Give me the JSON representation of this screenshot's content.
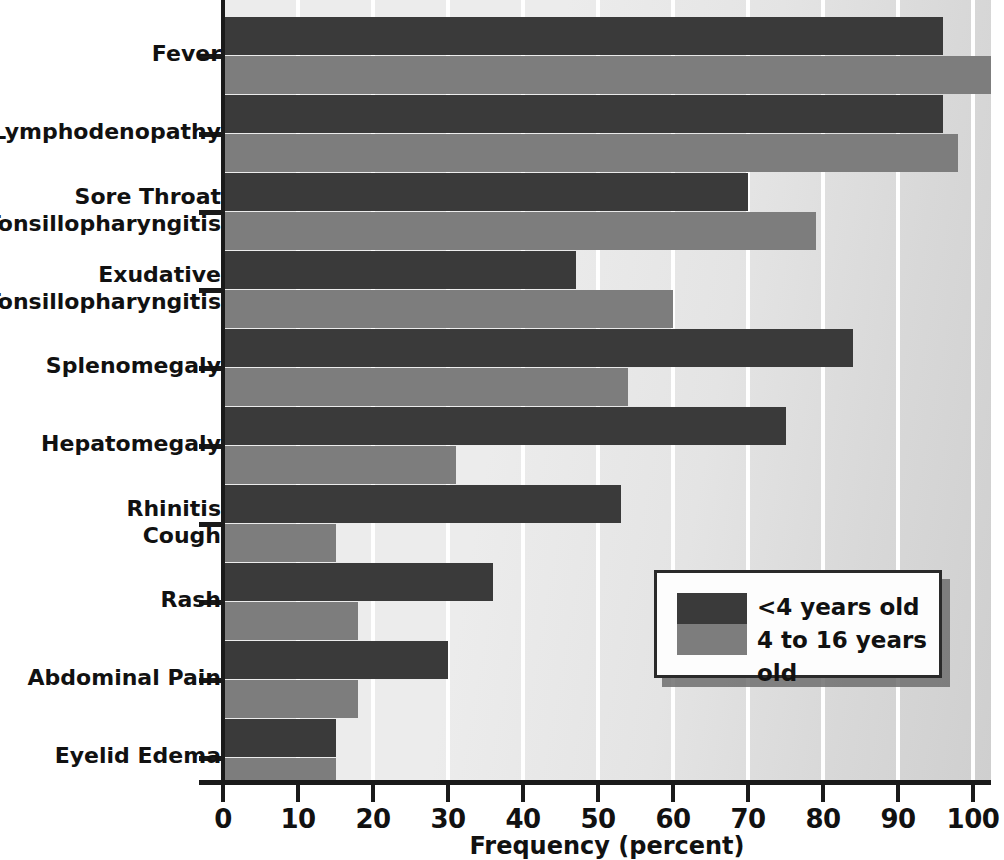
{
  "chart_data": {
    "type": "bar",
    "orientation": "horizontal",
    "title": "",
    "xlabel": "Frequency (percent)",
    "ylabel": "",
    "xlim": [
      0,
      103
    ],
    "xticks": [
      0,
      10,
      20,
      30,
      40,
      50,
      60,
      70,
      80,
      90,
      100
    ],
    "xtick_labels": [
      "0",
      "10",
      "20",
      "30",
      "40",
      "50",
      "60",
      "70",
      "80",
      "90",
      "100"
    ],
    "grid": "vertical",
    "legend_position": "inside-lower-right",
    "categories": [
      "Fever",
      "Lymphodenopathy",
      "Sore Throat\nTonsillopharyngitis",
      "Exudative\nTonsillopharyngitis",
      "Splenomegaly",
      "Hepatomegaly",
      "Rhinitis\nCough",
      "Rash",
      "Abdominal Pain",
      "Eyelid Edema"
    ],
    "category_lines": [
      [
        "Fever"
      ],
      [
        "Lymphodenopathy"
      ],
      [
        "Sore Throat",
        "Tonsillopharyngitis"
      ],
      [
        "Exudative",
        "Tonsillopharyngitis"
      ],
      [
        "Splenomegaly"
      ],
      [
        "Hepatomegaly"
      ],
      [
        "Rhinitis",
        "Cough"
      ],
      [
        "Rash"
      ],
      [
        "Abdominal Pain"
      ],
      [
        "Eyelid Edema"
      ]
    ],
    "series": [
      {
        "name": "<4 years old",
        "color": "#3a3a3a",
        "values": [
          96,
          96,
          70,
          47,
          84,
          75,
          53,
          36,
          30,
          15
        ]
      },
      {
        "name": "4 to 16 years old",
        "color": "#7d7d7d",
        "values": [
          103,
          98,
          79,
          60,
          54,
          31,
          15,
          18,
          18,
          15
        ]
      }
    ]
  },
  "legend": {
    "entries": [
      {
        "label": "<4 years old",
        "color": "#3a3a3a"
      },
      {
        "label": "4 to 16 years old",
        "color": "#7d7d7d"
      }
    ]
  },
  "axis": {
    "x_title": "Frequency (percent)"
  },
  "colors": {
    "dark_series": "#3a3a3a",
    "gray_series": "#7d7d7d",
    "plot_background": "#ececec",
    "gridline": "#ffffff",
    "axis": "#1a1a1a",
    "text": "#111111"
  }
}
